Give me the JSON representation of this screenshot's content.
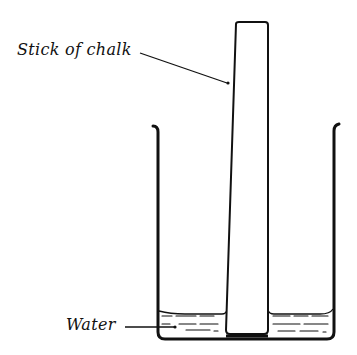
{
  "diagram": {
    "labels": {
      "chalk": "Stick of chalk",
      "water": "Water"
    },
    "colors": {
      "ink": "#111111",
      "background": "#ffffff",
      "stipple": "#333333"
    }
  }
}
